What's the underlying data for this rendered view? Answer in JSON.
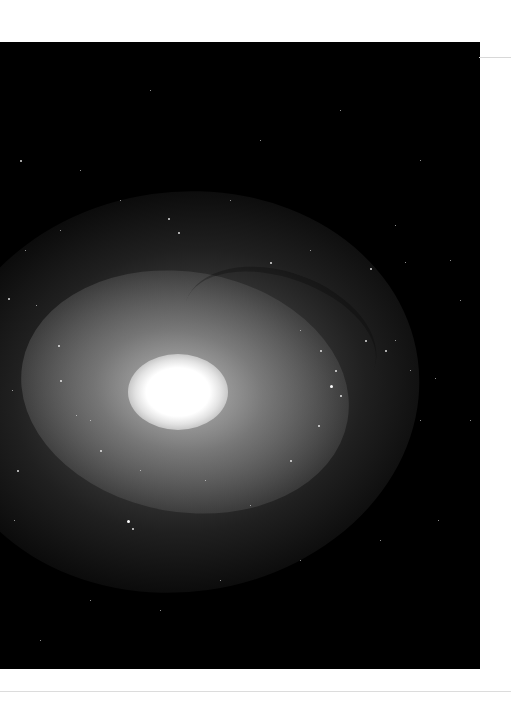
{
  "image": {
    "alt": "Spiral galaxy with bright core, greyscale telescope photograph",
    "subject": "spiral-galaxy",
    "palette": {
      "background": "#000000",
      "core": "#ffffff",
      "page": "#ffffff",
      "rule": "#d8d8d8"
    }
  },
  "stars": [
    [
      20,
      160,
      2
    ],
    [
      60,
      230,
      1
    ],
    [
      80,
      170,
      1
    ],
    [
      120,
      200,
      1
    ],
    [
      168,
      218,
      2
    ],
    [
      178,
      232,
      2
    ],
    [
      230,
      200,
      1
    ],
    [
      270,
      262,
      2
    ],
    [
      310,
      250,
      1
    ],
    [
      370,
      268,
      2
    ],
    [
      405,
      262,
      1
    ],
    [
      450,
      260,
      1
    ],
    [
      8,
      298,
      2
    ],
    [
      36,
      305,
      1
    ],
    [
      58,
      345,
      2
    ],
    [
      12,
      390,
      1
    ],
    [
      76,
      415,
      1
    ],
    [
      100,
      450,
      2
    ],
    [
      140,
      470,
      1
    ],
    [
      127,
      520,
      3
    ],
    [
      132,
      528,
      2
    ],
    [
      17,
      470,
      2
    ],
    [
      14,
      520,
      1
    ],
    [
      300,
      330,
      1
    ],
    [
      320,
      350,
      2
    ],
    [
      335,
      370,
      2
    ],
    [
      330,
      385,
      3
    ],
    [
      340,
      395,
      2
    ],
    [
      318,
      425,
      2
    ],
    [
      365,
      340,
      2
    ],
    [
      385,
      350,
      2
    ],
    [
      395,
      340,
      1
    ],
    [
      410,
      370,
      1
    ],
    [
      435,
      378,
      1
    ],
    [
      420,
      420,
      1
    ],
    [
      460,
      300,
      1
    ],
    [
      470,
      420,
      1
    ],
    [
      438,
      520,
      1
    ],
    [
      380,
      540,
      1
    ],
    [
      300,
      560,
      1
    ],
    [
      220,
      580,
      1
    ],
    [
      160,
      610,
      1
    ],
    [
      90,
      600,
      1
    ],
    [
      40,
      640,
      1
    ],
    [
      250,
      505,
      1
    ],
    [
      205,
      480,
      1
    ],
    [
      60,
      380,
      2
    ],
    [
      90,
      420,
      1
    ],
    [
      260,
      140,
      1
    ],
    [
      340,
      110,
      1
    ],
    [
      150,
      90,
      1
    ],
    [
      420,
      160,
      1
    ],
    [
      395,
      225,
      1
    ],
    [
      25,
      250,
      1
    ],
    [
      290,
      460,
      2
    ]
  ]
}
